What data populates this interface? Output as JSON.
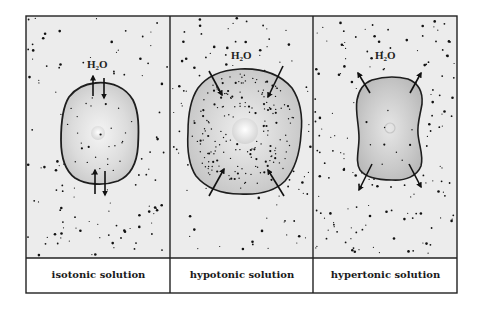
{
  "figure": {
    "panels": [
      {
        "id": "isotonic",
        "caption": "isotonic solution",
        "molecule_label": {
          "base": "H",
          "sub": "2",
          "tail": "O"
        },
        "water_flow": "both directions (net zero)",
        "cell_state": "normal"
      },
      {
        "id": "hypotonic",
        "caption": "hypotonic solution",
        "molecule_label": {
          "base": "H",
          "sub": "2",
          "tail": "O"
        },
        "water_flow": "into cell",
        "cell_state": "swollen"
      },
      {
        "id": "hypertonic",
        "caption": "hypertonic solution",
        "molecule_label": {
          "base": "H",
          "sub": "2",
          "tail": "O"
        },
        "water_flow": "out of cell",
        "cell_state": "shrunken"
      }
    ],
    "colors": {
      "frame": "#222222",
      "solution_background": "#ececec",
      "cell_fill": "#cfcfcf",
      "cell_outline": "#1e1e1e",
      "solute_dots": "#111111",
      "caption_background": "#ffffff"
    }
  }
}
